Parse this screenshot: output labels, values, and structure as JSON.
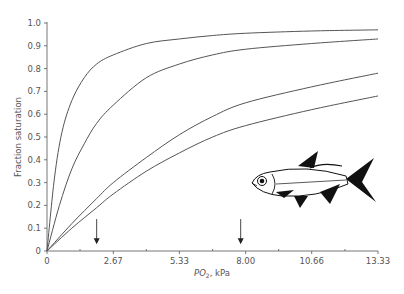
{
  "chart_data": {
    "type": "line",
    "title": "",
    "xlabel_italic": "PO",
    "xlabel_sub": "2",
    "xlabel_rest": ", kPa",
    "ylabel": "Fraction saturation",
    "xlim": [
      0,
      13.33
    ],
    "ylim": [
      0,
      1.0
    ],
    "x_ticks": [
      {
        "value": 0,
        "label": "0"
      },
      {
        "value": 2.67,
        "label": "2.67"
      },
      {
        "value": 5.33,
        "label": "5.33"
      },
      {
        "value": 8.0,
        "label": "8.00"
      },
      {
        "value": 10.66,
        "label": "10.66"
      },
      {
        "value": 13.33,
        "label": "13.33"
      }
    ],
    "x_minor_ticks": [
      1.33,
      4.0,
      6.67,
      9.33,
      12.0
    ],
    "y_ticks": [
      {
        "value": 0,
        "label": "0"
      },
      {
        "value": 0.1,
        "label": "0.1"
      },
      {
        "value": 0.2,
        "label": "0.2"
      },
      {
        "value": 0.3,
        "label": "0.3"
      },
      {
        "value": 0.4,
        "label": "0.4"
      },
      {
        "value": 0.5,
        "label": "0.5"
      },
      {
        "value": 0.6,
        "label": "0.6"
      },
      {
        "value": 0.7,
        "label": "0.7"
      },
      {
        "value": 0.8,
        "label": "0.8"
      },
      {
        "value": 0.9,
        "label": "0.9"
      },
      {
        "value": 1.0,
        "label": "1.0"
      }
    ],
    "grid": false,
    "series": [
      {
        "name": "curve-1",
        "x": [
          0,
          0.3,
          0.6,
          1.0,
          1.5,
          2.0,
          2.67,
          4.0,
          5.33,
          6.67,
          8.0,
          10.66,
          13.33
        ],
        "y": [
          0,
          0.32,
          0.52,
          0.66,
          0.76,
          0.82,
          0.86,
          0.91,
          0.93,
          0.945,
          0.955,
          0.965,
          0.97
        ]
      },
      {
        "name": "curve-2",
        "x": [
          0,
          0.5,
          1.0,
          1.5,
          2.0,
          2.67,
          4.0,
          5.33,
          6.67,
          8.0,
          10.66,
          13.33
        ],
        "y": [
          0,
          0.2,
          0.36,
          0.47,
          0.56,
          0.64,
          0.76,
          0.82,
          0.86,
          0.885,
          0.91,
          0.93
        ]
      },
      {
        "name": "curve-3",
        "x": [
          0,
          1.0,
          2.0,
          2.67,
          4.0,
          5.33,
          6.67,
          8.0,
          10.66,
          13.33
        ],
        "y": [
          0,
          0.12,
          0.23,
          0.3,
          0.41,
          0.51,
          0.59,
          0.65,
          0.72,
          0.78
        ]
      },
      {
        "name": "curve-4",
        "x": [
          0,
          1.0,
          2.0,
          2.67,
          4.0,
          5.33,
          6.67,
          8.0,
          10.66,
          13.33
        ],
        "y": [
          0,
          0.1,
          0.19,
          0.25,
          0.35,
          0.43,
          0.5,
          0.55,
          0.62,
          0.68
        ]
      }
    ],
    "annotations": [
      {
        "type": "arrow-down",
        "x": 2.0,
        "from_y": 0.14,
        "to_y": 0.03
      },
      {
        "type": "arrow-down",
        "x": 7.8,
        "from_y": 0.14,
        "to_y": 0.03
      },
      {
        "type": "illustration",
        "label": "fish"
      }
    ]
  }
}
